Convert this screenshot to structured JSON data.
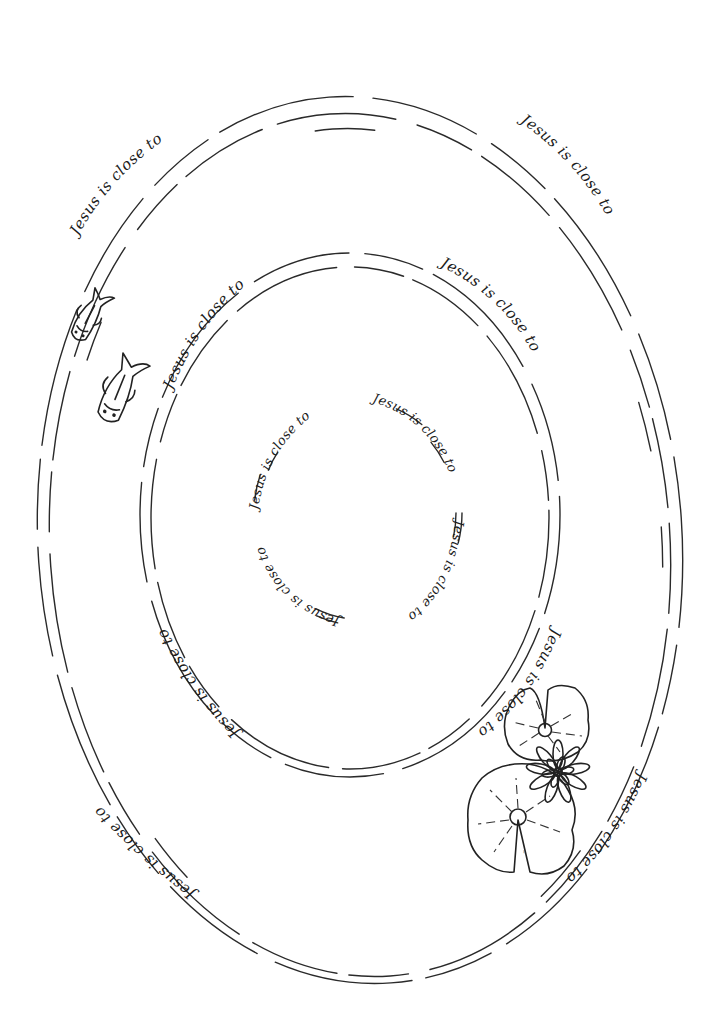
{
  "page": {
    "background": "#ffffff",
    "ink_color": "#222222"
  },
  "phrase": "Jesus is close to",
  "outer_ring": {
    "labels": [
      {
        "id": "outer-top-left",
        "text": "Jesus is close to"
      },
      {
        "id": "outer-top-right",
        "text": "Jesus is close to"
      },
      {
        "id": "outer-bottom-left",
        "text": "Jesus is close to"
      },
      {
        "id": "outer-bottom-right",
        "text": "Jesus is close to"
      }
    ]
  },
  "middle_ring": {
    "labels": [
      {
        "id": "middle-top-left",
        "text": "Jesus is close to"
      },
      {
        "id": "middle-top-right",
        "text": "Jesus is close to"
      },
      {
        "id": "middle-bottom-left",
        "text": "Jesus is close to"
      },
      {
        "id": "middle-bottom-right",
        "text": "Jesus is close to"
      }
    ]
  },
  "inner_ring": {
    "labels": [
      {
        "id": "inner-top-left",
        "text": "Jesus is close to"
      },
      {
        "id": "inner-top-right",
        "text": "Jesus is close to"
      },
      {
        "id": "inner-bottom-right",
        "text": "Jesus is close to"
      },
      {
        "id": "inner-bottom-left",
        "text": "Jesus is close to"
      }
    ]
  },
  "illustrations": {
    "fish_count": 2,
    "lily_pads": 2,
    "lotus_flower": 1,
    "signature": "~"
  }
}
